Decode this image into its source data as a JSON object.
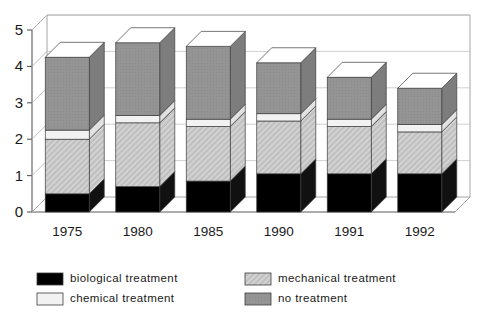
{
  "chart_data": {
    "type": "bar",
    "title": "",
    "subtitle": "",
    "xlabel": "",
    "ylabel": "",
    "stacked": true,
    "three_d": true,
    "grid": true,
    "legend_position": "bottom",
    "ylim": [
      0,
      5
    ],
    "yticks": [
      "0",
      "1",
      "2",
      "3",
      "4",
      "5"
    ],
    "ytick_values": [
      0,
      1,
      2,
      3,
      4,
      5
    ],
    "categories": [
      "1975",
      "1980",
      "1985",
      "1990",
      "1991",
      "1992"
    ],
    "series": [
      {
        "name": "biological treatment",
        "color": "#000000",
        "pattern": "solid",
        "values": [
          0.5,
          0.7,
          0.85,
          1.05,
          1.05,
          1.05
        ]
      },
      {
        "name": "mechanical treatment",
        "color": "#c8c8c8",
        "pattern": "hatch-light",
        "values": [
          1.5,
          1.75,
          1.5,
          1.45,
          1.3,
          1.15
        ]
      },
      {
        "name": "chemical treatment",
        "color": "#f0f0f0",
        "pattern": "solid",
        "values": [
          0.25,
          0.2,
          0.2,
          0.2,
          0.2,
          0.2
        ]
      },
      {
        "name": "no treatment",
        "color": "#919191",
        "pattern": "solid-gray",
        "values": [
          2.0,
          2.0,
          2.0,
          1.4,
          1.15,
          1.0
        ]
      }
    ],
    "totals": [
      4.25,
      4.65,
      4.55,
      4.1,
      3.7,
      3.4
    ],
    "cumulative_tops": [
      [
        0.5,
        2.0,
        2.25,
        4.25
      ],
      [
        0.7,
        2.45,
        2.65,
        4.65
      ],
      [
        0.85,
        2.35,
        2.55,
        4.55
      ],
      [
        1.05,
        2.5,
        2.7,
        4.1
      ],
      [
        1.05,
        2.35,
        2.55,
        3.7
      ],
      [
        1.05,
        2.2,
        2.4,
        3.4
      ]
    ]
  },
  "legend": {
    "entries": [
      {
        "label": "biological treatment",
        "swatch": "black"
      },
      {
        "label": "chemical treatment",
        "swatch": "white"
      },
      {
        "label": "mechanical treatment",
        "swatch": "hatch"
      },
      {
        "label": "no treatment",
        "swatch": "gray"
      }
    ]
  }
}
